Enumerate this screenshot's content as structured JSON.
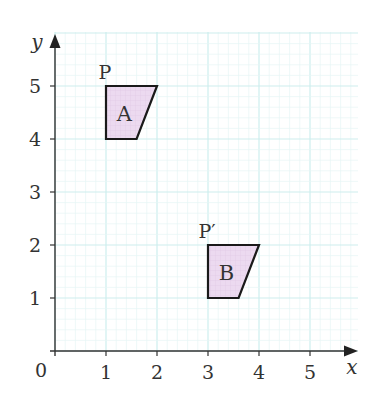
{
  "diagram": {
    "type": "coordinate-grid-translation",
    "axes": {
      "x_label": "x",
      "y_label": "y",
      "origin_label": "0",
      "x_ticks": [
        "1",
        "2",
        "3",
        "4",
        "5"
      ],
      "y_ticks": [
        "1",
        "2",
        "3",
        "4",
        "5"
      ],
      "x_range": [
        0,
        5.9
      ],
      "y_range": [
        0,
        6
      ]
    },
    "grid": {
      "major_color": "#cdeeee",
      "minor_color": "#e6f6f6",
      "minor_per_unit": 5
    },
    "shapes": [
      {
        "name": "A",
        "label": "A",
        "vertices": [
          [
            1,
            5
          ],
          [
            2,
            5
          ],
          [
            1.6,
            4
          ],
          [
            1,
            4
          ]
        ],
        "fill": "#ead8ee",
        "stroke": "#1a1a1a",
        "point_label": "P",
        "point": [
          1,
          5
        ]
      },
      {
        "name": "B",
        "label": "B",
        "vertices": [
          [
            3,
            2
          ],
          [
            4,
            2
          ],
          [
            3.6,
            1
          ],
          [
            3,
            1
          ]
        ],
        "fill": "#ead8ee",
        "stroke": "#1a1a1a",
        "point_label": "P′",
        "point": [
          3,
          2
        ]
      }
    ]
  }
}
